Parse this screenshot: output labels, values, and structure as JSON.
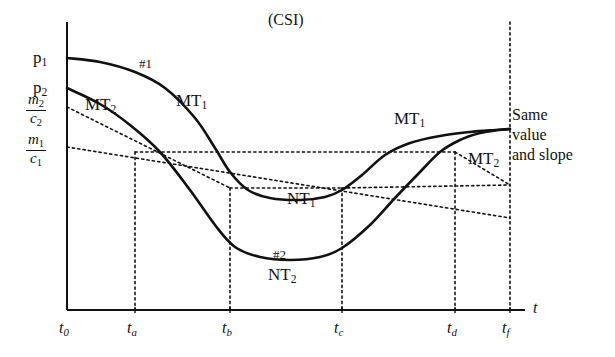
{
  "figure": {
    "title": "(CSI)",
    "x_axis_label": "t",
    "background": "#ffffff",
    "ink_color": "#111111"
  },
  "y_axis_labels": [
    {
      "id": "p1",
      "text": "p",
      "sub": "1",
      "type": "plain",
      "y": 58
    },
    {
      "id": "p2",
      "text": "p",
      "sub": "2",
      "type": "plain",
      "y": 88
    },
    {
      "id": "m2c2",
      "numerator": "m",
      "numerator_sub": "2",
      "denominator": "c",
      "denominator_sub": "2",
      "type": "fraction",
      "y": 107
    },
    {
      "id": "m1c1",
      "numerator": "m",
      "numerator_sub": "1",
      "denominator": "c",
      "denominator_sub": "1",
      "type": "fraction",
      "y": 147
    }
  ],
  "x_ticks": [
    {
      "id": "t0",
      "text": "t",
      "sub": "0",
      "x": 67
    },
    {
      "id": "ta",
      "text": "t",
      "sub": "a",
      "x": 135
    },
    {
      "id": "tb",
      "text": "t",
      "sub": "b",
      "x": 230
    },
    {
      "id": "tc",
      "text": "t",
      "sub": "c",
      "x": 342
    },
    {
      "id": "td",
      "text": "t",
      "sub": "d",
      "x": 455
    },
    {
      "id": "tf",
      "text": "t",
      "sub": "f",
      "x": 510
    }
  ],
  "curve_labels": [
    {
      "id": "hash1",
      "text": "#1",
      "x": 139,
      "y": 57,
      "size": "small"
    },
    {
      "id": "hash2",
      "text": "#2",
      "x": 273,
      "y": 248,
      "size": "small"
    },
    {
      "id": "mt2-left",
      "text": "MT",
      "sub": "2",
      "x": 85,
      "y": 96
    },
    {
      "id": "mt1-left",
      "text": "MT",
      "sub": "1",
      "x": 176,
      "y": 92
    },
    {
      "id": "nt1",
      "text": "NT",
      "sub": "1",
      "x": 287,
      "y": 190
    },
    {
      "id": "nt2",
      "text": "NT",
      "sub": "2",
      "x": 268,
      "y": 266
    },
    {
      "id": "mt1-right",
      "text": "MT",
      "sub": "1",
      "x": 394,
      "y": 110
    },
    {
      "id": "mt2-right",
      "text": "MT",
      "sub": "2",
      "x": 468,
      "y": 150
    }
  ],
  "annotation": {
    "id": "same-value-and-slope",
    "lines": [
      "Same",
      "value",
      "and slope"
    ],
    "x": 512,
    "y": 105
  },
  "chart_data": {
    "type": "line",
    "title": "(CSI)",
    "xlabel": "t",
    "ylabel": "",
    "grid": false,
    "legend": "inline-annotations",
    "axis_origin": {
      "x": 67,
      "y": 310
    },
    "axis_end_x": 525,
    "axis_top_y": 22,
    "series": [
      {
        "name": "#1",
        "description": "Curve 1: starts at p1, maintenance MT1, drops to NT1 trough, recovers to shared endpoint at tf",
        "style": "solid",
        "points": [
          [
            67,
            58
          ],
          [
            100,
            62
          ],
          [
            135,
            72
          ],
          [
            165,
            88
          ],
          [
            195,
            118
          ],
          [
            215,
            148
          ],
          [
            230,
            172
          ],
          [
            248,
            190
          ],
          [
            270,
            198
          ],
          [
            300,
            200
          ],
          [
            325,
            197
          ],
          [
            342,
            190
          ],
          [
            362,
            175
          ],
          [
            385,
            155
          ],
          [
            410,
            143
          ],
          [
            440,
            136
          ],
          [
            470,
            132
          ],
          [
            495,
            130
          ],
          [
            510,
            129
          ]
        ]
      },
      {
        "name": "#2",
        "description": "Curve 2: starts at p2, maintenance MT2, drops to NT2 trough, recovers steeply to shared endpoint at tf",
        "style": "solid",
        "points": [
          [
            67,
            88
          ],
          [
            100,
            104
          ],
          [
            130,
            125
          ],
          [
            160,
            152
          ],
          [
            190,
            190
          ],
          [
            215,
            225
          ],
          [
            235,
            247
          ],
          [
            260,
            257
          ],
          [
            290,
            260
          ],
          [
            320,
            257
          ],
          [
            342,
            248
          ],
          [
            370,
            225
          ],
          [
            395,
            198
          ],
          [
            420,
            172
          ],
          [
            440,
            152
          ],
          [
            460,
            140
          ],
          [
            480,
            133
          ],
          [
            498,
            130
          ],
          [
            510,
            129
          ]
        ]
      }
    ],
    "dotted_construction_lines": [
      {
        "id": "m2c2-descending",
        "from": [
          67,
          107
        ],
        "to": [
          230,
          188
        ],
        "style": "dotted"
      },
      {
        "id": "m1c1-descending",
        "from": [
          67,
          147
        ],
        "to": [
          510,
          218
        ],
        "style": "dotted"
      },
      {
        "id": "horizontal-upper",
        "from": [
          135,
          152
        ],
        "to": [
          455,
          152
        ],
        "style": "dotted"
      },
      {
        "id": "horizontal-lower",
        "from": [
          230,
          188
        ],
        "to": [
          342,
          188
        ],
        "style": "dotted"
      },
      {
        "id": "nt1-to-td-descending",
        "from": [
          342,
          188
        ],
        "to": [
          510,
          185
        ],
        "style": "dotted"
      },
      {
        "id": "td-descending-right",
        "from": [
          455,
          152
        ],
        "to": [
          510,
          185
        ],
        "style": "dotted"
      },
      {
        "id": "vertical-ta",
        "from": [
          135,
          152
        ],
        "to": [
          135,
          310
        ],
        "style": "dotted"
      },
      {
        "id": "vertical-tb",
        "from": [
          230,
          188
        ],
        "to": [
          230,
          310
        ],
        "style": "dotted"
      },
      {
        "id": "vertical-tc",
        "from": [
          342,
          188
        ],
        "to": [
          342,
          310
        ],
        "style": "dotted"
      },
      {
        "id": "vertical-td",
        "from": [
          455,
          152
        ],
        "to": [
          455,
          310
        ],
        "style": "dotted"
      },
      {
        "id": "vertical-tf",
        "from": [
          510,
          22
        ],
        "to": [
          510,
          310
        ],
        "style": "dotted"
      }
    ]
  }
}
